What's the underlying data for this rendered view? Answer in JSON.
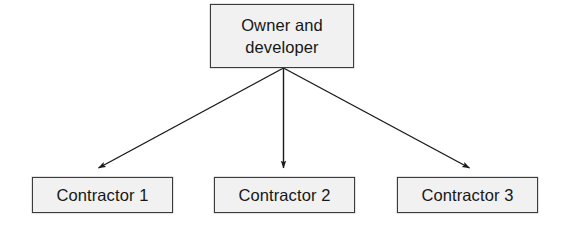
{
  "diagram": {
    "type": "organizational-hierarchy",
    "title": "",
    "style": {
      "background_color": "#ffffff",
      "node_fill_color": "#f1f1f1",
      "node_border_color": "#3b3b3b",
      "text_color": "#171717",
      "connector_color": "#1a1a1a"
    },
    "root": {
      "id": "owner-developer",
      "label": "Owner and\ndeveloper",
      "label_plain": "Owner and developer"
    },
    "children": [
      {
        "id": "contractor-1",
        "label": "Contractor 1"
      },
      {
        "id": "contractor-2",
        "label": "Contractor 2"
      },
      {
        "id": "contractor-3",
        "label": "Contractor 3"
      }
    ],
    "connectors": [
      {
        "id": "arrow-owner-to-contractor-1",
        "from": "owner-developer",
        "to": "contractor-1",
        "arrowhead": "filled-triangle",
        "direction": "down-left"
      },
      {
        "id": "arrow-owner-to-contractor-2",
        "from": "owner-developer",
        "to": "contractor-2",
        "arrowhead": "filled-triangle",
        "direction": "down"
      },
      {
        "id": "arrow-owner-to-contractor-3",
        "from": "owner-developer",
        "to": "contractor-3",
        "arrowhead": "filled-triangle",
        "direction": "down-right"
      }
    ]
  }
}
